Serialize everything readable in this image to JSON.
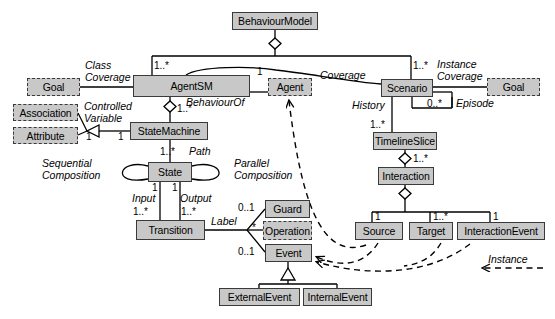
{
  "diagram": {
    "type": "uml-class-diagram",
    "colors": {
      "node_fill": "#c8c8c8",
      "node_stroke": "#3a3a3a",
      "line": "#000000",
      "background": "#ffffff"
    }
  },
  "nodes": [
    {
      "id": "behaviourmodel",
      "label": "BehaviourModel",
      "style": "solid"
    },
    {
      "id": "goal_left",
      "label": "Goal",
      "style": "dashed"
    },
    {
      "id": "agentsm",
      "label": "AgentSM",
      "style": "solid"
    },
    {
      "id": "agent",
      "label": "Agent",
      "style": "dashed"
    },
    {
      "id": "scenario",
      "label": "Scenario",
      "style": "solid"
    },
    {
      "id": "goal_right",
      "label": "Goal",
      "style": "dashed"
    },
    {
      "id": "association",
      "label": "Association",
      "style": "dashed"
    },
    {
      "id": "attribute",
      "label": "Attribute",
      "style": "dashed"
    },
    {
      "id": "statemachine",
      "label": "StateMachine",
      "style": "solid"
    },
    {
      "id": "timelineslice",
      "label": "TimelineSlice",
      "style": "solid"
    },
    {
      "id": "state",
      "label": "State",
      "style": "solid"
    },
    {
      "id": "interaction",
      "label": "Interaction",
      "style": "solid"
    },
    {
      "id": "transition",
      "label": "Transition",
      "style": "solid"
    },
    {
      "id": "guard",
      "label": "Guard",
      "style": "solid"
    },
    {
      "id": "operation",
      "label": "Operation",
      "style": "dashed"
    },
    {
      "id": "event",
      "label": "Event",
      "style": "solid"
    },
    {
      "id": "source",
      "label": "Source",
      "style": "solid"
    },
    {
      "id": "target",
      "label": "Target",
      "style": "solid"
    },
    {
      "id": "interactionevent",
      "label": "InteractionEvent",
      "style": "solid"
    },
    {
      "id": "externalevent",
      "label": "ExternalEvent",
      "style": "solid"
    },
    {
      "id": "internalevent",
      "label": "InternalEvent",
      "style": "solid"
    }
  ],
  "edge_labels": [
    {
      "id": "class_coverage",
      "line1": "Class",
      "line2": "Coverage"
    },
    {
      "id": "instance_coverage",
      "line1": "Instance",
      "line2": "Coverage"
    },
    {
      "id": "controlled_variable",
      "line1": "Controlled",
      "line2": "Variable"
    },
    {
      "id": "sequential_comp",
      "line1": "Sequential",
      "line2": "Composition"
    },
    {
      "id": "parallel_comp",
      "line1": "Parallel",
      "line2": "Composition"
    },
    {
      "id": "behaviourof",
      "line1": "BehaviourOf",
      "line2": ""
    },
    {
      "id": "coverage",
      "line1": "Coverage",
      "line2": ""
    },
    {
      "id": "episode",
      "line1": "Episode",
      "line2": ""
    },
    {
      "id": "history",
      "line1": "History",
      "line2": ""
    },
    {
      "id": "path",
      "line1": "Path",
      "line2": ""
    },
    {
      "id": "input",
      "line1": "Input",
      "line2": ""
    },
    {
      "id": "output",
      "line1": "Output",
      "line2": ""
    },
    {
      "id": "label",
      "line1": "Label",
      "line2": ""
    },
    {
      "id": "instance_legend",
      "line1": "Instance",
      "line2": ""
    }
  ],
  "multiplicities": [
    {
      "id": "m_agentsm_top",
      "value": "1..*"
    },
    {
      "id": "m_scenario_top",
      "value": "1..*"
    },
    {
      "id": "m_agent_left",
      "value": "1"
    },
    {
      "id": "m_agentsm_sm",
      "value": "1..*"
    },
    {
      "id": "m_assoc_one",
      "value": "1"
    },
    {
      "id": "m_sm_one",
      "value": "1"
    },
    {
      "id": "m_episode",
      "value": "0..*"
    },
    {
      "id": "m_history",
      "value": "1..*"
    },
    {
      "id": "m_state_path",
      "value": "1..*"
    },
    {
      "id": "m_state_in",
      "value": "1"
    },
    {
      "id": "m_state_out",
      "value": "1"
    },
    {
      "id": "m_input",
      "value": "1..*"
    },
    {
      "id": "m_output",
      "value": "1..*"
    },
    {
      "id": "m_guard",
      "value": "0..1"
    },
    {
      "id": "m_operation",
      "value": "*"
    },
    {
      "id": "m_event",
      "value": "0..1"
    },
    {
      "id": "m_interaction",
      "value": "1..*"
    },
    {
      "id": "m_source",
      "value": "1"
    },
    {
      "id": "m_target",
      "value": "1..*"
    },
    {
      "id": "m_interactionevent",
      "value": "1"
    }
  ]
}
